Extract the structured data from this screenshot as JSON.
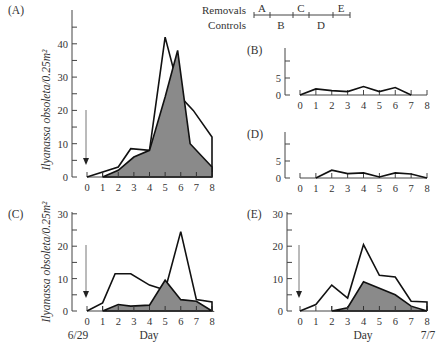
{
  "legend": {
    "removals_label": "Removals",
    "controls_label": "Controls",
    "removals_segments": [
      "A",
      "C",
      "E"
    ],
    "controls_segments": [
      "B",
      "D"
    ]
  },
  "axis_labels": {
    "ylabel": "Ilyanassa obsoleta/0.25m²",
    "xlabel": "Day",
    "start_date": "6/29",
    "end_date": "7/7"
  },
  "chart_data": [
    {
      "panel": "A",
      "type": "line",
      "ylim": [
        0,
        45
      ],
      "yticks": [
        0,
        10,
        20,
        30,
        40
      ],
      "x": [
        0,
        1,
        2,
        3,
        4,
        5,
        6,
        7,
        8
      ],
      "series": [
        {
          "name": "open",
          "x": [
            0,
            2,
            2.8,
            4,
            5,
            6,
            6.8,
            8,
            8
          ],
          "values": [
            0,
            3,
            8.5,
            8,
            42,
            24,
            20,
            12,
            0
          ]
        },
        {
          "name": "shaded",
          "x": [
            1,
            2,
            3,
            4,
            5,
            5.8,
            6.6,
            8
          ],
          "values": [
            0,
            2,
            6,
            8,
            24,
            38,
            10,
            3
          ],
          "filled": true
        }
      ],
      "xlabel": "",
      "ylabel": "Ilyanassa obsoleta/0.25m²"
    },
    {
      "panel": "B",
      "type": "line",
      "ylim": [
        0,
        10
      ],
      "yticks": [
        0,
        5
      ],
      "x": [
        0,
        1,
        2,
        3,
        4,
        5,
        6,
        7,
        8
      ],
      "series": [
        {
          "name": "control",
          "x": [
            0,
            1,
            2,
            3,
            4,
            5,
            6,
            7
          ],
          "values": [
            0,
            1.8,
            1.3,
            1,
            2.5,
            1,
            2.2,
            0
          ]
        }
      ]
    },
    {
      "panel": "D",
      "type": "line",
      "ylim": [
        0,
        10
      ],
      "yticks": [
        0,
        5
      ],
      "x": [
        0,
        1,
        2,
        3,
        4,
        5,
        6,
        7,
        8
      ],
      "series": [
        {
          "name": "control",
          "x": [
            1,
            2,
            3,
            4,
            5,
            6,
            7,
            8
          ],
          "values": [
            0,
            2.3,
            1.3,
            1.5,
            0.3,
            1.5,
            1.2,
            0
          ]
        }
      ]
    },
    {
      "panel": "C",
      "type": "line",
      "ylim": [
        0,
        30
      ],
      "yticks": [
        0,
        10,
        20,
        30
      ],
      "x": [
        0,
        1,
        2,
        3,
        4,
        5,
        6,
        7,
        8
      ],
      "series": [
        {
          "name": "open",
          "x": [
            0,
            1,
            1.8,
            2.8,
            4,
            5,
            6,
            7,
            8,
            8
          ],
          "values": [
            0,
            2.5,
            11.5,
            11.5,
            8,
            6.5,
            24.5,
            3.5,
            2.8,
            0
          ]
        },
        {
          "name": "shaded",
          "x": [
            1,
            2,
            2.8,
            4,
            5,
            6,
            7,
            8
          ],
          "values": [
            0,
            2,
            1.5,
            1.8,
            9.5,
            3.5,
            3,
            0
          ],
          "filled": true
        }
      ],
      "xlabel": "Day",
      "ylabel": "Ilyanassa obsoleta/0.25m²"
    },
    {
      "panel": "E",
      "type": "line",
      "ylim": [
        0,
        30
      ],
      "yticks": [
        0,
        10,
        20,
        30
      ],
      "x": [
        0,
        1,
        2,
        3,
        4,
        5,
        6,
        7,
        8
      ],
      "series": [
        {
          "name": "open",
          "x": [
            0,
            1,
            2,
            3,
            4,
            5,
            6,
            7,
            8,
            8
          ],
          "values": [
            0,
            2,
            8,
            4,
            20.5,
            11,
            10.5,
            3,
            2.8,
            0
          ]
        },
        {
          "name": "shaded",
          "x": [
            2,
            3,
            4,
            6,
            7,
            8
          ],
          "values": [
            0,
            1,
            9,
            5,
            1.5,
            0
          ],
          "filled": true
        }
      ],
      "xlabel": "Day"
    }
  ]
}
